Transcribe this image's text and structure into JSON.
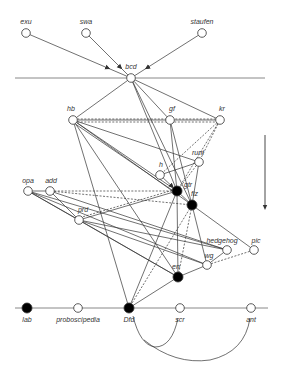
{
  "diagram": {
    "title": "",
    "colors": {
      "line": "#333333",
      "axis": "#888888",
      "filled": "#000000",
      "open": "#ffffff"
    },
    "nodes": [
      {
        "id": "exu",
        "label": "exu",
        "x": 26,
        "y": 33,
        "filled": false,
        "lx": 26,
        "ly": 24,
        "anchor": "middle"
      },
      {
        "id": "swa",
        "label": "swa",
        "x": 86,
        "y": 33,
        "filled": false,
        "lx": 86,
        "ly": 24,
        "anchor": "middle"
      },
      {
        "id": "staufen",
        "label": "staufen",
        "x": 202,
        "y": 33,
        "filled": false,
        "lx": 202,
        "ly": 24,
        "anchor": "middle"
      },
      {
        "id": "bcd",
        "label": "bcd",
        "x": 131,
        "y": 78,
        "filled": false,
        "lx": 131,
        "ly": 69,
        "anchor": "middle"
      },
      {
        "id": "hb",
        "label": "hb",
        "x": 73,
        "y": 120,
        "filled": false,
        "lx": 71,
        "ly": 111,
        "anchor": "middle"
      },
      {
        "id": "gf",
        "label": "gf",
        "x": 170,
        "y": 120,
        "filled": false,
        "lx": 172,
        "ly": 111,
        "anchor": "middle"
      },
      {
        "id": "kr",
        "label": "kr",
        "x": 220,
        "y": 120,
        "filled": false,
        "lx": 222,
        "ly": 111,
        "anchor": "middle"
      },
      {
        "id": "runt",
        "label": "runt",
        "x": 199,
        "y": 162,
        "filled": false,
        "lx": 198,
        "ly": 155,
        "anchor": "middle"
      },
      {
        "id": "h",
        "label": "h",
        "x": 160,
        "y": 175,
        "filled": false,
        "lx": 161,
        "ly": 167,
        "anchor": "middle"
      },
      {
        "id": "gtr",
        "label": "gtr",
        "x": 177,
        "y": 191,
        "filled": true,
        "lx": 184,
        "ly": 187,
        "anchor": "start"
      },
      {
        "id": "fiz",
        "label": "fiz",
        "x": 192,
        "y": 205,
        "filled": true,
        "lx": 191,
        "ly": 196,
        "anchor": "start"
      },
      {
        "id": "opa",
        "label": "opa",
        "x": 28,
        "y": 191,
        "filled": false,
        "lx": 28,
        "ly": 183,
        "anchor": "middle"
      },
      {
        "id": "add",
        "label": "add",
        "x": 50,
        "y": 191,
        "filled": false,
        "lx": 51,
        "ly": 183,
        "anchor": "middle"
      },
      {
        "id": "prd",
        "label": "prd",
        "x": 79,
        "y": 220,
        "filled": false,
        "lx": 83,
        "ly": 212,
        "anchor": "middle"
      },
      {
        "id": "hedgehog",
        "label": "hedgehog",
        "x": 227,
        "y": 250,
        "filled": false,
        "lx": 222,
        "ly": 243,
        "anchor": "middle"
      },
      {
        "id": "pic",
        "label": "pic",
        "x": 254,
        "y": 250,
        "filled": false,
        "lx": 256,
        "ly": 243,
        "anchor": "middle"
      },
      {
        "id": "wg",
        "label": "wg",
        "x": 207,
        "y": 265,
        "filled": false,
        "lx": 209,
        "ly": 258,
        "anchor": "middle"
      },
      {
        "id": "en",
        "label": "en",
        "x": 178,
        "y": 277,
        "filled": true,
        "lx": 176,
        "ly": 269,
        "anchor": "middle"
      },
      {
        "id": "lab",
        "label": "lab",
        "x": 27,
        "y": 308,
        "filled": true,
        "lx": 27,
        "ly": 322,
        "anchor": "middle"
      },
      {
        "id": "proboscipedia",
        "label": "proboscipedia",
        "x": 78,
        "y": 308,
        "filled": false,
        "lx": 78,
        "ly": 322,
        "anchor": "middle"
      },
      {
        "id": "Dfd",
        "label": "Dfd",
        "x": 129,
        "y": 308,
        "filled": true,
        "lx": 129,
        "ly": 322,
        "anchor": "middle"
      },
      {
        "id": "scr",
        "label": "scr",
        "x": 180,
        "y": 308,
        "filled": false,
        "lx": 180,
        "ly": 322,
        "anchor": "middle"
      },
      {
        "id": "ant",
        "label": "ant",
        "x": 251,
        "y": 308,
        "filled": false,
        "lx": 251,
        "ly": 322,
        "anchor": "middle"
      }
    ],
    "guides": [
      {
        "id": "top-axis",
        "x1": 15,
        "y1": 78,
        "x2": 265,
        "y2": 78
      },
      {
        "id": "bottom-axis",
        "x1": 15,
        "y1": 308,
        "x2": 268,
        "y2": 308
      }
    ],
    "direction_arrow": {
      "x": 265,
      "y1": 135,
      "y2": 210
    },
    "edges": [
      {
        "from": "exu",
        "to": "bcd",
        "style": "solid",
        "arrow": true
      },
      {
        "from": "swa",
        "to": "bcd",
        "style": "solid",
        "arrow": true
      },
      {
        "from": "staufen",
        "to": "bcd",
        "style": "solid",
        "arrow": true
      },
      {
        "from": "bcd",
        "to": "hb",
        "style": "solid"
      },
      {
        "from": "bcd",
        "to": "gf",
        "style": "solid"
      },
      {
        "from": "bcd",
        "to": "kr",
        "style": "solid"
      },
      {
        "from": "bcd",
        "to": "gtr",
        "style": "solid"
      },
      {
        "from": "bcd",
        "to": "fiz",
        "style": "solid"
      },
      {
        "from": "hb",
        "to": "gf",
        "style": "solid"
      },
      {
        "from": "hb",
        "to": "gf",
        "style": "dashed",
        "offset": 2
      },
      {
        "from": "gf",
        "to": "kr",
        "style": "solid"
      },
      {
        "from": "gf",
        "to": "kr",
        "style": "dashed",
        "offset": 2
      },
      {
        "from": "hb",
        "to": "kr",
        "style": "dashed",
        "offset": -1
      },
      {
        "from": "hb",
        "to": "runt",
        "style": "solid"
      },
      {
        "from": "hb",
        "to": "gtr",
        "style": "solid"
      },
      {
        "from": "hb",
        "to": "gtr",
        "style": "solid",
        "offset": 2
      },
      {
        "from": "hb",
        "to": "fiz",
        "style": "solid"
      },
      {
        "from": "hb",
        "to": "en",
        "style": "solid"
      },
      {
        "from": "hb",
        "to": "Dfd",
        "style": "solid"
      },
      {
        "from": "gf",
        "to": "gtr",
        "style": "solid"
      },
      {
        "from": "gf",
        "to": "fiz",
        "style": "solid"
      },
      {
        "from": "kr",
        "to": "runt",
        "style": "dashed"
      },
      {
        "from": "kr",
        "to": "h",
        "style": "dashed"
      },
      {
        "from": "kr",
        "to": "gtr",
        "style": "dashed"
      },
      {
        "from": "runt",
        "to": "h",
        "style": "solid"
      },
      {
        "from": "runt",
        "to": "gtr",
        "style": "dashed"
      },
      {
        "from": "runt",
        "to": "fiz",
        "style": "solid"
      },
      {
        "from": "h",
        "to": "gtr",
        "style": "solid",
        "arrow": true
      },
      {
        "from": "opa",
        "to": "add",
        "style": "solid"
      },
      {
        "from": "add",
        "to": "gtr",
        "style": "dashed"
      },
      {
        "from": "add",
        "to": "fiz",
        "style": "dashed"
      },
      {
        "from": "add",
        "to": "prd",
        "style": "solid"
      },
      {
        "from": "opa",
        "to": "prd",
        "style": "solid"
      },
      {
        "from": "opa",
        "to": "hedgehog",
        "style": "solid"
      },
      {
        "from": "opa",
        "to": "wg",
        "style": "solid"
      },
      {
        "from": "opa",
        "to": "en",
        "style": "solid"
      },
      {
        "from": "add",
        "to": "hedgehog",
        "style": "solid"
      },
      {
        "from": "prd",
        "to": "gtr",
        "style": "solid"
      },
      {
        "from": "prd",
        "to": "hedgehog",
        "style": "solid"
      },
      {
        "from": "prd",
        "to": "wg",
        "style": "solid"
      },
      {
        "from": "prd",
        "to": "en",
        "style": "solid"
      },
      {
        "from": "gtr",
        "to": "fiz",
        "style": "solid"
      },
      {
        "from": "gtr",
        "to": "en",
        "style": "solid"
      },
      {
        "from": "gtr",
        "to": "Dfd",
        "style": "solid"
      },
      {
        "from": "fiz",
        "to": "en",
        "style": "dashed"
      },
      {
        "from": "fiz",
        "to": "Dfd",
        "style": "dashed"
      },
      {
        "from": "fiz",
        "to": "wg",
        "style": "solid"
      },
      {
        "from": "fiz",
        "to": "pic",
        "style": "solid"
      },
      {
        "from": "wg",
        "to": "hedgehog",
        "style": "solid"
      },
      {
        "from": "wg",
        "to": "pic",
        "style": "dashed"
      },
      {
        "from": "en",
        "to": "wg",
        "style": "solid"
      },
      {
        "from": "en",
        "to": "Dfd",
        "style": "solid"
      },
      {
        "from": "gtr",
        "to": "prd",
        "style": "dashed",
        "offset": 2
      }
    ],
    "arcs": [
      {
        "from": "Dfd",
        "to": "scr",
        "d": "M 133 316 Q 140 345 155 347 Q 172 347 178 318"
      },
      {
        "from": "Dfd",
        "to": "ant",
        "d": "M 144 340 Q 175 365 210 360 Q 245 352 250 318"
      }
    ]
  }
}
